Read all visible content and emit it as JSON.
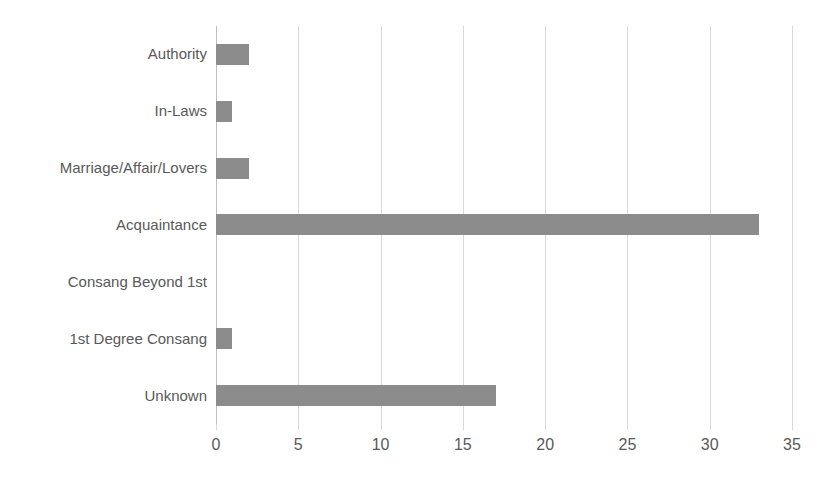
{
  "chart_data": {
    "type": "bar",
    "orientation": "horizontal",
    "title": "",
    "subtitle": "",
    "xlabel": "",
    "ylabel": "",
    "categories": [
      "Authority",
      "In-Laws",
      "Marriage/Affair/Lovers",
      "Acquaintance",
      "Consang Beyond 1st",
      "1st Degree Consang",
      "Unknown"
    ],
    "values": [
      2,
      1,
      2,
      33,
      0,
      1,
      17
    ],
    "xlim": [
      0,
      35
    ],
    "xticks": [
      0,
      5,
      10,
      15,
      20,
      25,
      30,
      35
    ],
    "xtick_labels": [
      "0",
      "5",
      "10",
      "15",
      "20",
      "25",
      "30",
      "35"
    ],
    "grid": {
      "vertical": true,
      "horizontal": false,
      "color": "#d9d9d9"
    },
    "legend": {
      "visible": false,
      "position": "none",
      "entries": []
    },
    "colors": {
      "bar": "#8c8c8c",
      "gridline": "#d9d9d9",
      "axis": "#bfbfbf",
      "label_text": "#595959",
      "background": "#ffffff"
    },
    "annotations": []
  }
}
